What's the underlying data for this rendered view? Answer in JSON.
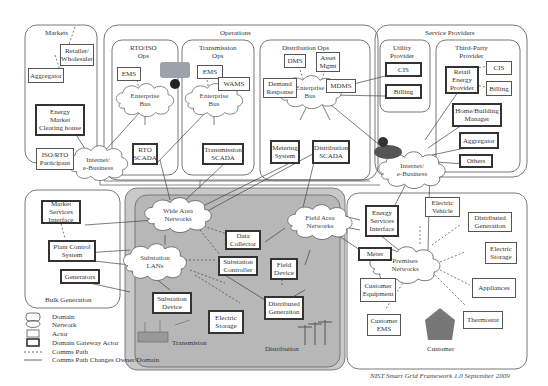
{
  "domains": {
    "markets": "Markets",
    "operations": "Operations",
    "rto_iso_ops": "RTO/ISO\nOps",
    "transmission_ops": "Transmission\nOps",
    "distribution_ops": "Distribution Ops",
    "service_providers": "Service Providers",
    "utility_provider": "Utility\nProvider",
    "third_party_provider": "Third-Party\nProvider",
    "bulk_generation": "Bulk Generation",
    "transmission": "Transmision",
    "distribution": "Distribution",
    "customer": "Customer"
  },
  "networks": {
    "internet_left": "Internet/\ne-Business",
    "internet_right": "Internet/\ne-Business",
    "enterprise_bus_rto": "Enterprise\nBus",
    "enterprise_bus_trans": "Enterprise\nBus",
    "enterprise_bus_dist": "Enterprise\nBus",
    "wide_area_networks": "Wide Area\nNetworks",
    "field_area_networks": "Field Area\nNetworks",
    "substation_lans": "Substation\nLANs",
    "premises_networks": "Premises\nNetworks"
  },
  "actors": {
    "retailer_wholesaler": "Retailer/\nWholesaler",
    "aggregator_markets": "Aggregator",
    "energy_market_clearing_house": "Energy\nMarket\nClearing house",
    "iso_rto_participant": "ISO/RTO\nParticipant",
    "ems_rto": "EMS",
    "rto_scada": "RTO\nSCADA",
    "ems_trans": "EMS",
    "wams": "WAMS",
    "transmission_scada": "Transmission\nSCADA",
    "dms": "DMS",
    "asset_mgmt": "Asset\nMgmt",
    "demand_response": "Demand\nResponse",
    "mdms": "MDMS",
    "metering_system": "Metering\nSystem",
    "distribution_scada": "Distribution\nSCADA",
    "cis_utility": "CIS",
    "billing_utility": "Billing",
    "retail_energy_provider": "Retail\nEnergy\nProvider",
    "cis_third": "CIS",
    "billing_third": "Billing",
    "home_building_manager": "Home/Building\nManager",
    "aggregator_sp": "Aggregator",
    "others": "Others",
    "market_services_interface": "Market\nServices\nInterface",
    "plant_control_system": "Plant Control\nSystem",
    "generators": "Generators",
    "data_collector": "Data\nCollector",
    "substation_controller": "Substation\nController",
    "substation_device": "Substation\nDevice",
    "electric_storage_dist": "Electric\nStorage",
    "field_device": "Field\nDevice",
    "distributed_generation_dist": "Distributed\nGeneration",
    "energy_services_interface": "Energy\nServices\nInterface",
    "meter": "Meter",
    "electric_vehicle": "Electric\nVehicle",
    "distributed_generation_cust": "Distributed\nGeneration",
    "electric_storage_cust": "Electric\nStorage",
    "appliances": "Appliances",
    "thermostat": "Thermostat",
    "customer_equipment": "Customer\nEquipment",
    "customer_ems": "Customer\nEMS"
  },
  "legend": {
    "domain": "Domain",
    "network": "Network",
    "actor": "Actor",
    "gateway_actor": "Domain Gateway Actor",
    "comms_path": "Comms Path",
    "comms_path_changes": "Comms Path Changes Owner/Domain"
  },
  "caption": "NIST Smart Grid Framework 1.0 September 2009"
}
